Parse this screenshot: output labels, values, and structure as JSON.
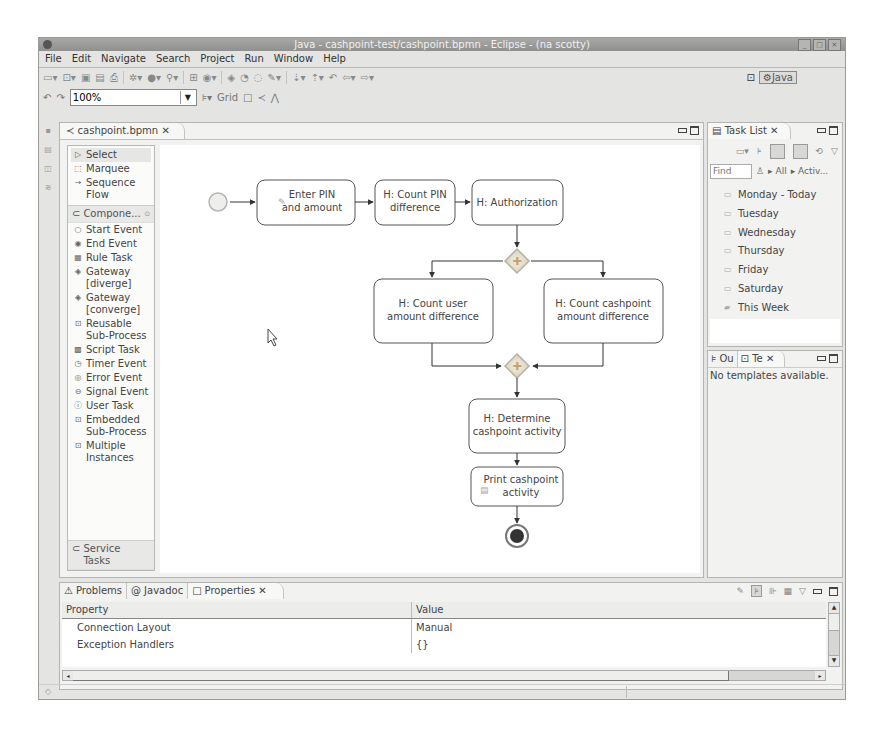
{
  "window": {
    "title": "Java - cashpoint-test/cashpoint.bpmn - Eclipse - (na scotty)",
    "controls": [
      "minimize",
      "maximize",
      "close"
    ]
  },
  "menu": [
    "File",
    "Edit",
    "Navigate",
    "Search",
    "Project",
    "Run",
    "Window",
    "Help"
  ],
  "toolbar": {
    "zoom_value": "100%",
    "grid_label": "Grid",
    "perspective": "Java"
  },
  "editor": {
    "tab_label": "cashpoint.bpmn",
    "palette": {
      "tools": [
        {
          "label": "Select",
          "icon": "arrow-cursor-icon"
        },
        {
          "label": "Marquee",
          "icon": "marquee-icon"
        },
        {
          "label": "Sequence Flow",
          "icon": "arrow-right-icon"
        }
      ],
      "drawer_label": "Compone...",
      "components": [
        {
          "label": "Start Event",
          "icon": "start-event-icon"
        },
        {
          "label": "End Event",
          "icon": "end-event-icon"
        },
        {
          "label": "Rule Task",
          "icon": "rule-task-icon"
        },
        {
          "label": "Gateway [diverge]",
          "icon": "gateway-diverge-icon"
        },
        {
          "label": "Gateway [converge]",
          "icon": "gateway-converge-icon"
        },
        {
          "label": "Reusable Sub-Process",
          "icon": "subprocess-icon"
        },
        {
          "label": "Script Task",
          "icon": "script-task-icon"
        },
        {
          "label": "Timer Event",
          "icon": "timer-event-icon"
        },
        {
          "label": "Error Event",
          "icon": "error-event-icon"
        },
        {
          "label": "Signal Event",
          "icon": "signal-event-icon"
        },
        {
          "label": "User Task",
          "icon": "user-task-icon"
        },
        {
          "label": "Embedded Sub-Process",
          "icon": "embedded-subprocess-icon"
        },
        {
          "label": "Multiple Instances",
          "icon": "multiple-instances-icon"
        }
      ],
      "bottom_drawer_label": "Service Tasks"
    },
    "diagram": {
      "tasks": {
        "enter_pin_1": "Enter PIN",
        "enter_pin_2": "and amount",
        "count_pin_1": "H: Count PIN",
        "count_pin_2": "difference",
        "authorization": "H: Authorization",
        "count_user_1": "H: Count user",
        "count_user_2": "amount difference",
        "count_cash_1": "H: Count cashpoint",
        "count_cash_2": "amount difference",
        "determine_1": "H: Determine",
        "determine_2": "cashpoint activity",
        "print_1": "Print cashpoint",
        "print_2": "activity"
      }
    }
  },
  "task_list": {
    "tab_label": "Task List",
    "find_placeholder": "Find",
    "filter_all": "All",
    "filter_active": "Activ...",
    "items": [
      "Monday - Today",
      "Tuesday",
      "Wednesday",
      "Thursday",
      "Friday",
      "Saturday",
      "This Week"
    ]
  },
  "outline_panel": {
    "tabs": [
      "Ou",
      "Te"
    ],
    "empty_message": "No templates available."
  },
  "bottom_panel": {
    "tabs": [
      "Problems",
      "Javadoc",
      "Properties"
    ],
    "columns": [
      "Property",
      "Value"
    ],
    "rows": [
      {
        "property": "Connection Layout",
        "value": "Manual"
      },
      {
        "property": "Exception Handlers",
        "value": "{}"
      }
    ]
  }
}
